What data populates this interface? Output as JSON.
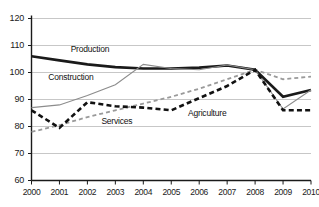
{
  "chart_data": {
    "type": "line",
    "title": "",
    "subtitle": "",
    "xlabel": "",
    "ylabel": "",
    "x": [
      2000,
      2001,
      2002,
      2003,
      2004,
      2005,
      2006,
      2007,
      2008,
      2009,
      2010
    ],
    "xtick_labels": [
      "2000",
      "2001",
      "2002",
      "2003",
      "2004",
      "2005",
      "2006",
      "2007",
      "2008",
      "2009",
      "2010"
    ],
    "ytick_labels": [
      "60",
      "70",
      "80",
      "90",
      "100",
      "110",
      "120"
    ],
    "yticks": [
      60,
      70,
      80,
      90,
      100,
      110,
      120
    ],
    "ylim": [
      60,
      120
    ],
    "xlim": [
      2000,
      2010
    ],
    "grid": "horizontal",
    "legend": "inline-labels",
    "series": [
      {
        "name": "Production",
        "label": "Production",
        "style": "solid",
        "color": "#1a1a1a",
        "width": 2.6,
        "values": [
          106.0,
          104.5,
          103.0,
          102.0,
          101.5,
          101.5,
          101.8,
          102.6,
          101.0,
          91.0,
          93.5
        ]
      },
      {
        "name": "Construction",
        "label": "Construction",
        "style": "solid",
        "color": "#8c8c8c",
        "width": 1.1,
        "values": [
          87.0,
          88.0,
          91.5,
          95.5,
          103.0,
          101.5,
          101.0,
          102.8,
          101.0,
          86.5,
          93.5
        ]
      },
      {
        "name": "Services",
        "label": "Services",
        "style": "dashed",
        "color": "#9a9a9a",
        "width": 1.8,
        "values": [
          78.0,
          80.5,
          83.5,
          86.0,
          88.5,
          91.0,
          94.0,
          97.5,
          101.0,
          97.5,
          98.5
        ]
      },
      {
        "name": "Agriculture",
        "label": "Agriculture",
        "style": "dashed",
        "color": "#111111",
        "width": 2.6,
        "values": [
          86.0,
          79.5,
          89.0,
          87.5,
          87.0,
          86.0,
          90.5,
          95.0,
          101.0,
          86.0,
          86.0
        ]
      }
    ],
    "inline_label_positions": [
      {
        "name": "Production",
        "x_year": 2001.4,
        "y_value": 108.5
      },
      {
        "name": "Construction",
        "x_year": 2000.6,
        "y_value": 98.0
      },
      {
        "name": "Services",
        "x_year": 2002.5,
        "y_value": 81.5
      },
      {
        "name": "Agriculture",
        "x_year": 2005.6,
        "y_value": 84.5
      }
    ],
    "colors": {
      "axis": "#1a1a1a",
      "grid": "#b9b9b9",
      "background": "#ffffff",
      "production": "#1a1a1a",
      "construction": "#8c8c8c",
      "services": "#9a9a9a",
      "agriculture": "#111111"
    }
  }
}
